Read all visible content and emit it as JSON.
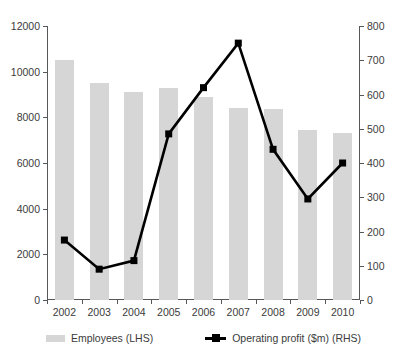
{
  "chart_data": {
    "type": "bar",
    "title": "",
    "subtitle": "",
    "xlabel": "",
    "ylabel": "",
    "grid": false,
    "legend_position": "bottom",
    "categories": [
      "2002",
      "2003",
      "2004",
      "2005",
      "2006",
      "2007",
      "2008",
      "2009",
      "2010"
    ],
    "axes": {
      "left": {
        "label": "",
        "ylim": [
          0,
          12000
        ],
        "ticks": [
          0,
          2000,
          4000,
          6000,
          8000,
          10000,
          12000
        ],
        "tick_labels": [
          "0",
          "2000",
          "4000",
          "6000",
          "8000",
          "10000",
          "12000"
        ]
      },
      "right": {
        "label": "",
        "ylim": [
          0,
          800
        ],
        "ticks": [
          0,
          100,
          200,
          300,
          400,
          500,
          600,
          700,
          800
        ],
        "tick_labels": [
          "0",
          "100",
          "200",
          "300",
          "400",
          "500",
          "600",
          "700",
          "800"
        ]
      }
    },
    "series": [
      {
        "name": "Employees (LHS)",
        "type": "bar",
        "axis": "left",
        "color": "#d6d6d6",
        "values": [
          10500,
          9500,
          9100,
          9300,
          8900,
          8400,
          8350,
          7450,
          7300
        ]
      },
      {
        "name": "Operating profit ($m) (RHS)",
        "type": "line",
        "axis": "right",
        "color": "#000000",
        "marker": "square",
        "values": [
          175,
          90,
          115,
          485,
          620,
          750,
          440,
          295,
          400
        ]
      }
    ]
  },
  "legend": {
    "items": [
      {
        "label": "Employees (LHS)",
        "marker": "bar-swatch",
        "color": "#d6d6d6"
      },
      {
        "label": "Operating profit ($m) (RHS)",
        "marker": "line-square",
        "color": "#000000"
      }
    ]
  }
}
